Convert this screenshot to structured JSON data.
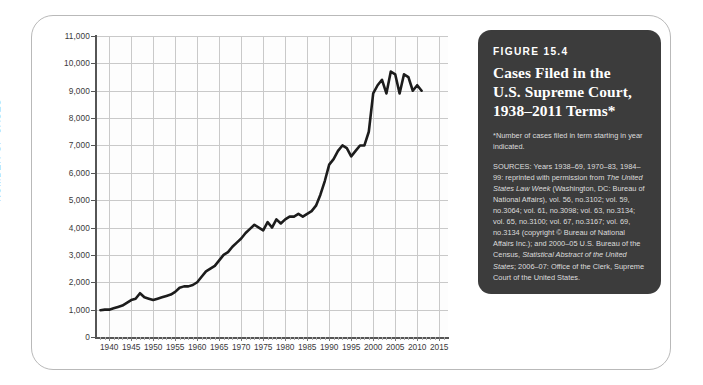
{
  "panel": {
    "figure_number": "FIGURE 15.4",
    "title_line1": "Cases Filed in the",
    "title_line2": "U.S. Supreme Court,",
    "title_line3": "1938–2011 Terms*",
    "footnote": "*Number of cases filed in term starting in year indicated.",
    "sources_label": "SOURCES:",
    "sources_text": " Years 1938–69, 1970–83, 1984–99: reprinted with permission from ",
    "sources_italic1": "The United States Law Week",
    "sources_text2": " (Washington, DC: Bureau of National Affairs), vol. 56, no.3102; vol. 59, no.3064; vol. 61, no.3098; vol. 63, no.3134; vol. 65, no.3100; vol. 67, no.3167; vol. 69, no.3134 (copyright © Bureau of National Affairs Inc.); and 2000–05 U.S. Bureau of the Census, ",
    "sources_italic2": "Statistical Abstract of the United States",
    "sources_text3": "; 2006–07: Office of the Clerk, Supreme Court of the United States.",
    "background_color": "#3c3c3c",
    "text_color": "#f1f1f1"
  },
  "chart_data": {
    "type": "line",
    "title": "Cases Filed in the U.S. Supreme Court, 1938–2011 Terms",
    "xlabel": "",
    "ylabel": "NUMBER OF CASES",
    "xlim": [
      1937,
      2017
    ],
    "ylim": [
      0,
      11000
    ],
    "grid": true,
    "legend": null,
    "line_color": "#1c1c1c",
    "ytick_labels": [
      "0",
      "1,000",
      "2,000",
      "3,000",
      "4,000",
      "5,000",
      "6,000",
      "7,000",
      "8,000",
      "9,000",
      "10,000",
      "11,000"
    ],
    "ytick_values": [
      0,
      1000,
      2000,
      3000,
      4000,
      5000,
      6000,
      7000,
      8000,
      9000,
      10000,
      11000
    ],
    "xtick_labels": [
      "1940",
      "1945",
      "1950",
      "1955",
      "1960",
      "1965",
      "1970",
      "1975",
      "1980",
      "1985",
      "1990",
      "1995",
      "2000",
      "2005",
      "2010",
      "2015"
    ],
    "xtick_values": [
      1940,
      1945,
      1950,
      1955,
      1960,
      1965,
      1970,
      1975,
      1980,
      1985,
      1990,
      1995,
      2000,
      2005,
      2010,
      2015
    ],
    "series": [
      {
        "name": "Cases filed",
        "x": [
          1938,
          1939,
          1940,
          1941,
          1942,
          1943,
          1944,
          1945,
          1946,
          1947,
          1948,
          1949,
          1950,
          1951,
          1952,
          1953,
          1954,
          1955,
          1956,
          1957,
          1958,
          1959,
          1960,
          1961,
          1962,
          1963,
          1964,
          1965,
          1966,
          1967,
          1968,
          1969,
          1970,
          1971,
          1972,
          1973,
          1974,
          1975,
          1976,
          1977,
          1978,
          1979,
          1980,
          1981,
          1982,
          1983,
          1984,
          1985,
          1986,
          1987,
          1988,
          1989,
          1990,
          1991,
          1992,
          1993,
          1994,
          1995,
          1996,
          1997,
          1998,
          1999,
          2000,
          2001,
          2002,
          2003,
          2004,
          2005,
          2006,
          2007,
          2008,
          2009,
          2010,
          2011
        ],
        "values": [
          980,
          1000,
          1000,
          1050,
          1100,
          1150,
          1250,
          1350,
          1400,
          1600,
          1450,
          1400,
          1350,
          1400,
          1450,
          1500,
          1550,
          1650,
          1800,
          1850,
          1850,
          1900,
          2000,
          2200,
          2400,
          2500,
          2600,
          2800,
          3000,
          3100,
          3300,
          3450,
          3600,
          3800,
          3950,
          4100,
          4000,
          3900,
          4200,
          4000,
          4300,
          4150,
          4300,
          4400,
          4400,
          4500,
          4400,
          4500,
          4600,
          4800,
          5200,
          5700,
          6300,
          6500,
          6800,
          7000,
          6900,
          6600,
          6800,
          7000,
          7000,
          7500,
          8900,
          9200,
          9400,
          8900,
          9700,
          9600,
          8900,
          9600,
          9500,
          9000,
          9200,
          9000
        ]
      }
    ]
  }
}
